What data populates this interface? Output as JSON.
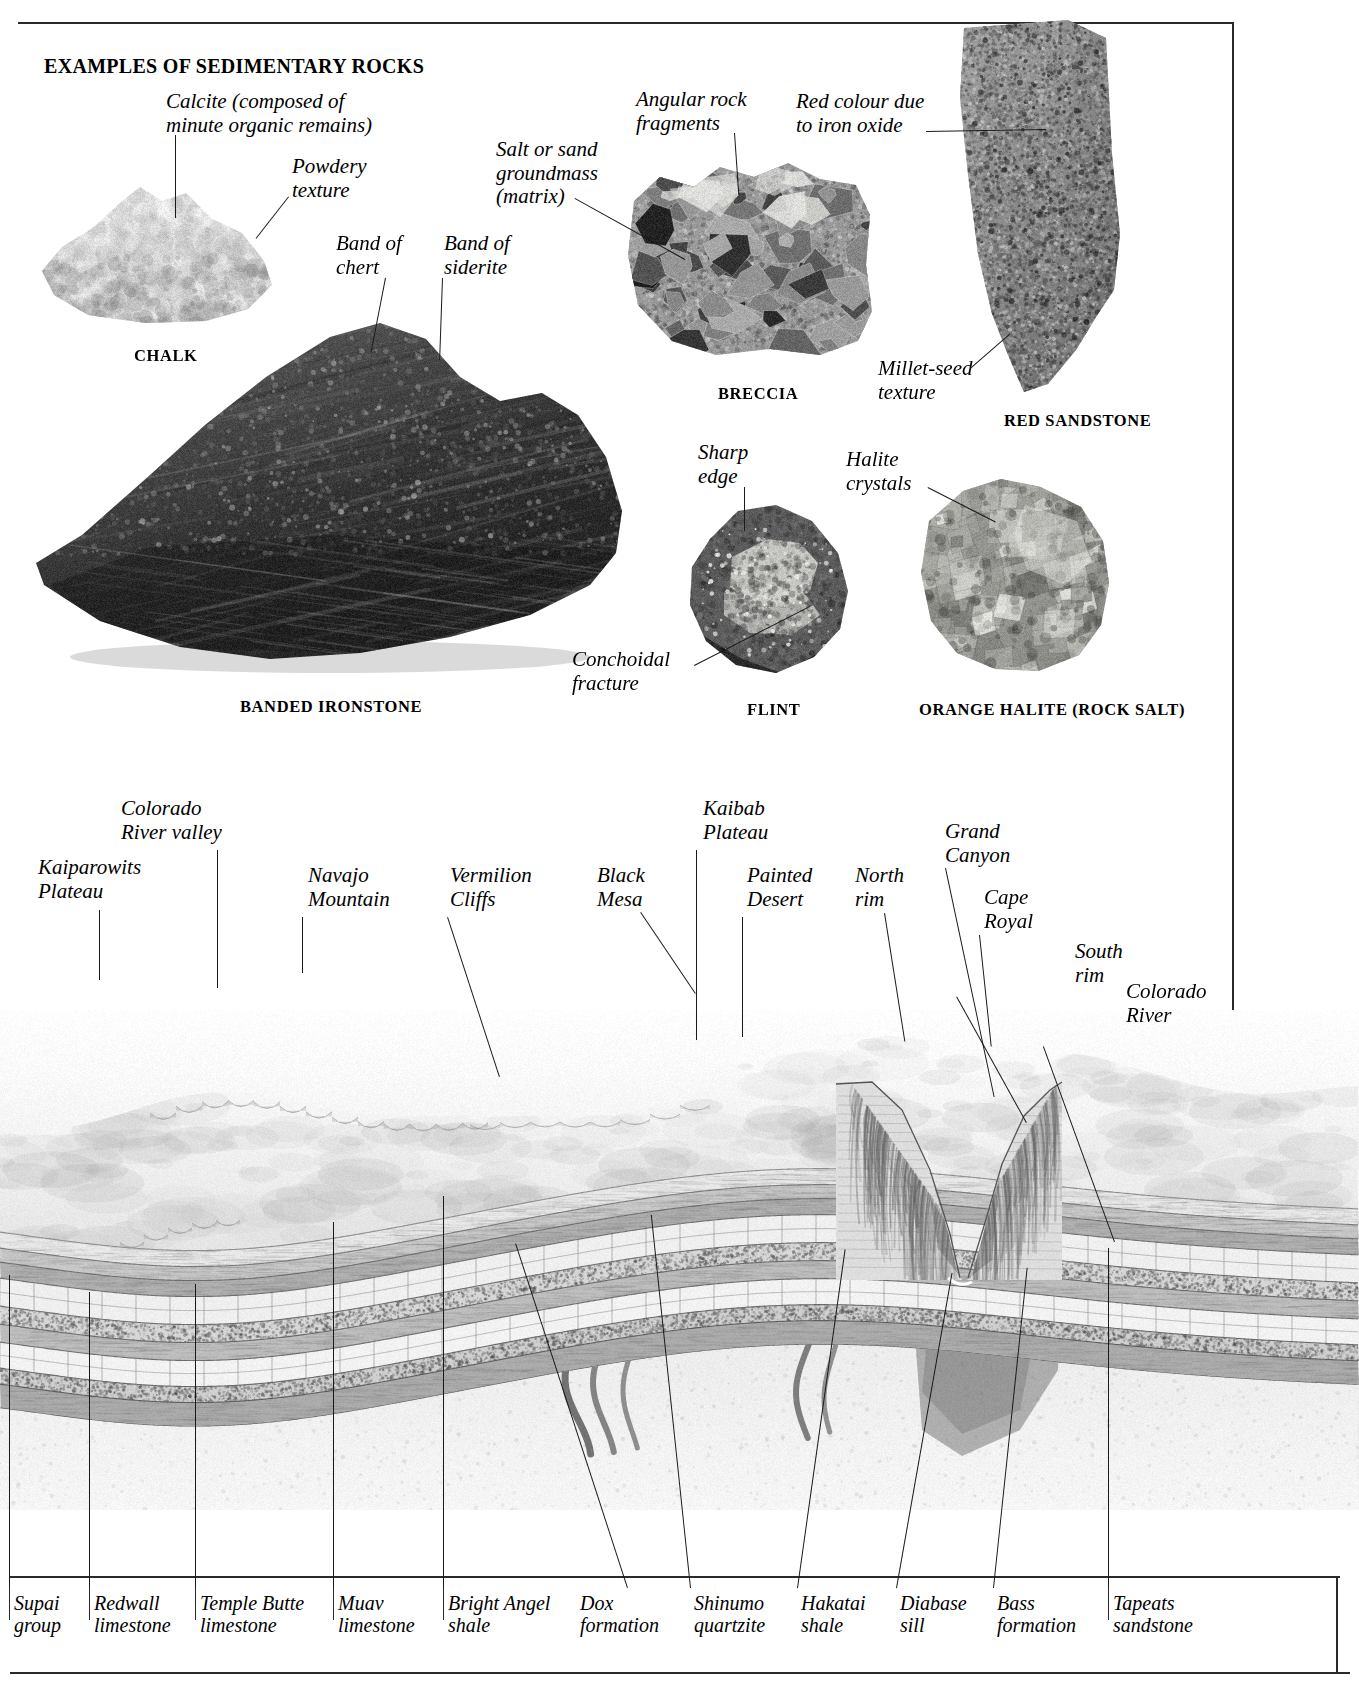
{
  "header": {
    "title": "EXAMPLES OF SEDIMENTARY ROCKS"
  },
  "specimens": [
    {
      "name": "chalk",
      "caption": "CHALK",
      "annotations": [
        {
          "key": "calcite",
          "text": "Calcite (composed of\nminute organic remains)"
        },
        {
          "key": "powdery",
          "text": "Powdery\ntexture"
        }
      ]
    },
    {
      "name": "banded-ironstone",
      "caption": "BANDED IRONSTONE",
      "annotations": [
        {
          "key": "band-chert",
          "text": "Band of\nchert"
        },
        {
          "key": "band-siderite",
          "text": "Band of\nsiderite"
        }
      ]
    },
    {
      "name": "breccia",
      "caption": "BRECCIA",
      "annotations": [
        {
          "key": "angular",
          "text": "Angular rock\nfragments"
        },
        {
          "key": "matrix",
          "text": "Salt or sand\ngroundmass\n(matrix)"
        }
      ]
    },
    {
      "name": "red-sandstone",
      "caption": "RED SANDSTONE",
      "annotations": [
        {
          "key": "iron-oxide",
          "text": "Red colour due\nto iron oxide"
        },
        {
          "key": "millet-seed",
          "text": "Millet-seed\ntexture"
        }
      ]
    },
    {
      "name": "flint",
      "caption": "FLINT",
      "annotations": [
        {
          "key": "sharp-edge",
          "text": "Sharp\nedge"
        },
        {
          "key": "conchoidal",
          "text": "Conchoidal\nfracture"
        }
      ]
    },
    {
      "name": "orange-halite",
      "caption": "ORANGE HALITE (ROCK SALT)",
      "annotations": [
        {
          "key": "halite-crystals",
          "text": "Halite\ncrystals"
        }
      ]
    }
  ],
  "landscape": {
    "features": [
      {
        "key": "kaiparowits-plateau",
        "text": "Kaiparowits\nPlateau"
      },
      {
        "key": "colorado-river-valley",
        "text": "Colorado\nRiver valley"
      },
      {
        "key": "navajo-mountain",
        "text": "Navajo\nMountain"
      },
      {
        "key": "vermilion-cliffs",
        "text": "Vermilion\nCliffs"
      },
      {
        "key": "black-mesa",
        "text": "Black\nMesa"
      },
      {
        "key": "kaibab-plateau",
        "text": "Kaibab\nPlateau"
      },
      {
        "key": "painted-desert",
        "text": "Painted\nDesert"
      },
      {
        "key": "north-rim",
        "text": "North\nrim"
      },
      {
        "key": "grand-canyon",
        "text": "Grand\nCanyon"
      },
      {
        "key": "cape-royal",
        "text": "Cape\nRoyal"
      },
      {
        "key": "south-rim",
        "text": "South\nrim"
      },
      {
        "key": "colorado-river",
        "text": "Colorado\nRiver"
      }
    ],
    "strata": [
      {
        "key": "supai-group",
        "text": "Supai\ngroup"
      },
      {
        "key": "redwall-limestone",
        "text": "Redwall\nlimestone"
      },
      {
        "key": "temple-butte-limestone",
        "text": "Temple Butte\nlimestone"
      },
      {
        "key": "muav-limestone",
        "text": "Muav\nlimestone"
      },
      {
        "key": "bright-angel-shale",
        "text": "Bright Angel\nshale"
      },
      {
        "key": "dox-formation",
        "text": "Dox\nformation"
      },
      {
        "key": "shinumo-quartzite",
        "text": "Shinumo\nquartzite"
      },
      {
        "key": "hakatai-shale",
        "text": "Hakatai\nshale"
      },
      {
        "key": "diabase-sill",
        "text": "Diabase\nsill"
      },
      {
        "key": "bass-formation",
        "text": "Bass\nformation"
      },
      {
        "key": "tapeats-sandstone",
        "text": "Tapeats\nsandstone"
      }
    ]
  },
  "colors": {
    "ink": "#1a1a1a",
    "rule": "#2a2a2a",
    "paper": "#ffffff"
  }
}
